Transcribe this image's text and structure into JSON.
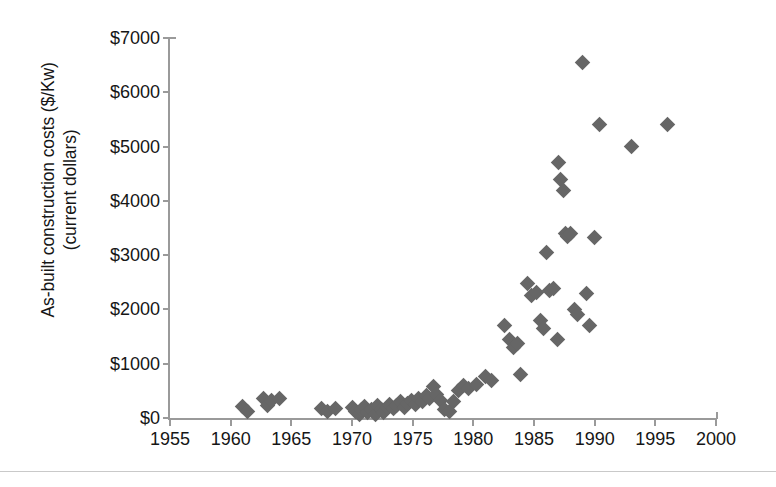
{
  "chart_data": {
    "type": "scatter",
    "title": "",
    "xlabel": "",
    "ylabel": "As-built construction costs ($/Kw) (current dollars)",
    "ylabel_lines": [
      "As-built construction costs ($/Kw)",
      "(current dollars)"
    ],
    "xlim": [
      1955,
      2000
    ],
    "ylim": [
      0,
      7000
    ],
    "xticks": [
      1955,
      1960,
      1965,
      1970,
      1975,
      1980,
      1985,
      1990,
      1995,
      2000
    ],
    "xtick_labels": [
      "1955",
      "1960",
      "1965",
      "1970",
      "1975",
      "1980",
      "1985",
      "1990",
      "1995",
      "2000"
    ],
    "yticks": [
      0,
      1000,
      2000,
      3000,
      4000,
      5000,
      6000,
      7000
    ],
    "ytick_labels": [
      "$0",
      "$1000",
      "$2000",
      "$3000",
      "$4000",
      "$5000",
      "$6000",
      "$7000"
    ],
    "grid": false,
    "legend": false,
    "marker": "diamond",
    "marker_color": "#666666",
    "axis_color": "#9a9a9a",
    "series": [
      {
        "name": "As-built construction cost",
        "points": [
          [
            1961.0,
            220
          ],
          [
            1961.4,
            120
          ],
          [
            1962.7,
            360
          ],
          [
            1963.0,
            230
          ],
          [
            1963.4,
            330
          ],
          [
            1964.0,
            360
          ],
          [
            1967.5,
            180
          ],
          [
            1968.0,
            120
          ],
          [
            1968.6,
            180
          ],
          [
            1970.0,
            200
          ],
          [
            1970.3,
            120
          ],
          [
            1970.6,
            60
          ],
          [
            1970.8,
            160
          ],
          [
            1971.0,
            210
          ],
          [
            1971.3,
            110
          ],
          [
            1971.6,
            150
          ],
          [
            1971.9,
            60
          ],
          [
            1972.1,
            230
          ],
          [
            1972.4,
            160
          ],
          [
            1972.6,
            100
          ],
          [
            1972.9,
            190
          ],
          [
            1973.1,
            250
          ],
          [
            1973.4,
            170
          ],
          [
            1973.7,
            230
          ],
          [
            1974.0,
            300
          ],
          [
            1974.3,
            200
          ],
          [
            1974.6,
            270
          ],
          [
            1974.9,
            330
          ],
          [
            1975.2,
            250
          ],
          [
            1975.5,
            360
          ],
          [
            1975.8,
            300
          ],
          [
            1976.1,
            420
          ],
          [
            1976.4,
            360
          ],
          [
            1976.7,
            580
          ],
          [
            1977.0,
            430
          ],
          [
            1977.3,
            330
          ],
          [
            1977.6,
            150
          ],
          [
            1978.0,
            120
          ],
          [
            1978.4,
            300
          ],
          [
            1978.8,
            500
          ],
          [
            1979.2,
            600
          ],
          [
            1979.6,
            540
          ],
          [
            1980.3,
            620
          ],
          [
            1981.0,
            760
          ],
          [
            1981.5,
            700
          ],
          [
            1982.6,
            1700
          ],
          [
            1983.0,
            1450
          ],
          [
            1983.3,
            1300
          ],
          [
            1983.6,
            1380
          ],
          [
            1983.9,
            800
          ],
          [
            1984.5,
            2470
          ],
          [
            1984.8,
            2250
          ],
          [
            1985.2,
            2320
          ],
          [
            1985.5,
            1800
          ],
          [
            1985.8,
            1650
          ],
          [
            1986.0,
            3050
          ],
          [
            1986.3,
            2350
          ],
          [
            1986.6,
            2380
          ],
          [
            1986.9,
            1450
          ],
          [
            1987.0,
            4700
          ],
          [
            1987.2,
            4400
          ],
          [
            1987.4,
            4200
          ],
          [
            1987.6,
            3400
          ],
          [
            1987.8,
            3350
          ],
          [
            1988.0,
            3400
          ],
          [
            1988.3,
            2000
          ],
          [
            1988.6,
            1900
          ],
          [
            1989.0,
            6550
          ],
          [
            1989.3,
            2300
          ],
          [
            1989.6,
            1700
          ],
          [
            1990.4,
            5400
          ],
          [
            1990.0,
            3330
          ],
          [
            1993.0,
            5000
          ],
          [
            1996.0,
            5400
          ]
        ]
      }
    ]
  },
  "figure": {
    "background": "#ffffff"
  }
}
